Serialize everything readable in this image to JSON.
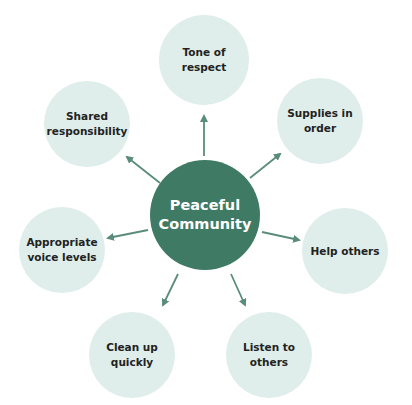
{
  "diagram": {
    "center": {
      "label": "Peaceful\nCommunity",
      "color": "#3f7a64",
      "text_color": "#ffffff"
    },
    "node_color": "#dfeeea",
    "arrow_color": "#5a8c7a",
    "nodes": [
      {
        "id": "tone-of-respect",
        "label": "Tone of\nrespect"
      },
      {
        "id": "supplies-in-order",
        "label": "Supplies in\norder"
      },
      {
        "id": "help-others",
        "label": "Help others"
      },
      {
        "id": "listen-to-others",
        "label": "Listen to\nothers"
      },
      {
        "id": "clean-up-quickly",
        "label": "Clean up\nquickly"
      },
      {
        "id": "appropriate-voice-levels",
        "label": "Appropriate\nvoice levels"
      },
      {
        "id": "shared-responsibility",
        "label": "Shared\nresponsibility"
      }
    ]
  }
}
